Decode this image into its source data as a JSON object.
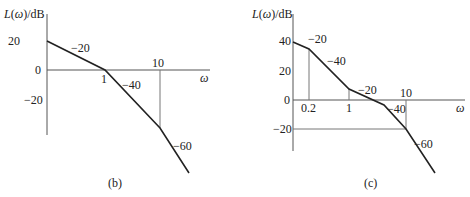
{
  "figures": [
    {
      "id": "b",
      "caption": "(b)",
      "y_axis_label_prefix": "L(",
      "y_axis_label_omega": "ω",
      "y_axis_label_suffix": ")/dB",
      "x_axis_label": "ω",
      "y_ticks": [
        "20",
        "0",
        "−20"
      ],
      "x_ticks": [
        "1",
        "10"
      ],
      "slope_labels": [
        "−20",
        "−40",
        "−60"
      ],
      "corners": [
        {
          "omega": 1,
          "dB": 0
        },
        {
          "omega": 10,
          "dB": -40
        }
      ],
      "segments": [
        {
          "from": "start",
          "to": 1,
          "slope": "-20 dB/dec"
        },
        {
          "from": 1,
          "to": 10,
          "slope": "-40 dB/dec"
        },
        {
          "from": 10,
          "to": "end",
          "slope": "-60 dB/dec"
        }
      ]
    },
    {
      "id": "c",
      "caption": "(c)",
      "y_axis_label_prefix": "L(",
      "y_axis_label_omega": "ω",
      "y_axis_label_suffix": ")/dB",
      "x_axis_label": "ω",
      "y_ticks": [
        "40",
        "20",
        "0",
        "−20"
      ],
      "x_ticks": [
        "0.2",
        "1",
        "10"
      ],
      "slope_labels": [
        "−20",
        "−40",
        "−20",
        "−40",
        "−60"
      ],
      "corners": [
        {
          "omega": 0.2
        },
        {
          "omega": 1
        },
        {
          "omega": "between 1 and 10"
        },
        {
          "omega": 10,
          "dB": -20
        }
      ],
      "segments": [
        {
          "from": "start",
          "to": 0.2,
          "slope": "-20 dB/dec"
        },
        {
          "from": 0.2,
          "to": 1,
          "slope": "-40 dB/dec"
        },
        {
          "from": 1,
          "to": "corner3",
          "slope": "-20 dB/dec"
        },
        {
          "from": "corner3",
          "to": 10,
          "slope": "-40 dB/dec"
        },
        {
          "from": 10,
          "to": "end",
          "slope": "-60 dB/dec"
        }
      ]
    }
  ]
}
